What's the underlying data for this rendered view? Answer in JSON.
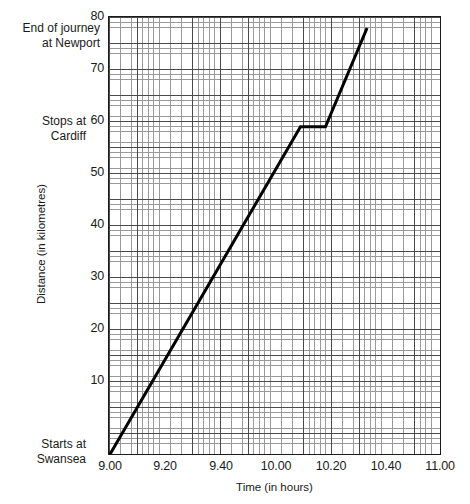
{
  "chart_data": {
    "type": "line",
    "title": "",
    "xlabel": "Time (in hours)",
    "ylabel": "Distance (in kilometres)",
    "xlim": [
      9.0,
      11.0
    ],
    "ylim": [
      0,
      80
    ],
    "grid": true,
    "legend": "none",
    "x_tick_labels": [
      "9.00",
      "9.20",
      "9.40",
      "10.00",
      "10.20",
      "10.40",
      "11.00"
    ],
    "x_tick_values": [
      9.0,
      9.2,
      9.4,
      10.0,
      10.2,
      10.4,
      11.0
    ],
    "y_tick_labels": [
      "10",
      "20",
      "30",
      "40",
      "50",
      "60",
      "70",
      "80"
    ],
    "y_tick_values": [
      10,
      20,
      30,
      40,
      50,
      60,
      70,
      80
    ],
    "series": [
      {
        "name": "Journey",
        "x": [
          9.0,
          10.15,
          10.3,
          10.55
        ],
        "values": [
          0,
          60,
          60,
          78
        ],
        "color": "#000000"
      }
    ],
    "annotations": [
      {
        "id": "newport",
        "text": "End of journey\nat Newport",
        "at_value": 78
      },
      {
        "id": "cardiff",
        "text": "Stops at\nCardiff",
        "at_value": 60
      },
      {
        "id": "swansea",
        "text": "Starts at\nSwansea",
        "at_value": 0
      }
    ]
  },
  "axes": {
    "y_title": "Distance (in kilometres)",
    "x_title": "Time (in hours)"
  }
}
